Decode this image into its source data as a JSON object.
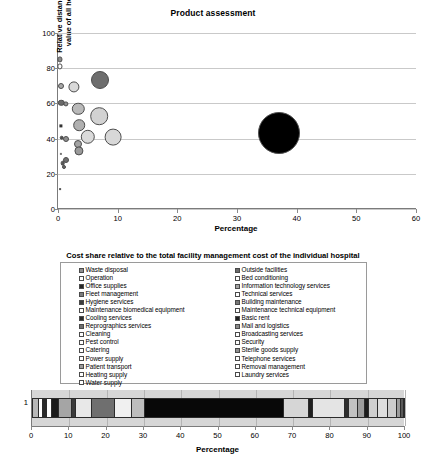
{
  "chart_data": [
    {
      "type": "scatter",
      "id": "bubble-chart",
      "title": "Product assessment",
      "xlabel": "Percentage",
      "ylabel": "Relative distance to average value of all hospitals (%)",
      "xlim": [
        0,
        60
      ],
      "ylim": [
        0,
        100
      ],
      "xticks": [
        0,
        10,
        20,
        30,
        40,
        50,
        60
      ],
      "yticks": [
        0,
        20,
        40,
        60,
        80,
        100
      ],
      "grid": "horizontal",
      "legend": "none",
      "points": [
        {
          "x": 0.35,
          "y": 85.0,
          "r": 2.6,
          "color": "#8c8c8c"
        },
        {
          "x": 0.35,
          "y": 81.0,
          "r": 2.6,
          "color": "#ffffff"
        },
        {
          "x": 0.45,
          "y": 70.0,
          "r": 3.0,
          "color": "#a8a8a8"
        },
        {
          "x": 2.6,
          "y": 69.5,
          "r": 5.6,
          "color": "#d9d9d9"
        },
        {
          "x": 7.0,
          "y": 73.5,
          "r": 9.0,
          "color": "#6e6e6e"
        },
        {
          "x": 0.55,
          "y": 60.5,
          "r": 3.2,
          "color": "#6b6b6b"
        },
        {
          "x": 1.3,
          "y": 59.8,
          "r": 2.6,
          "color": "#909090"
        },
        {
          "x": 3.4,
          "y": 57.0,
          "r": 6.2,
          "color": "#b9b9b9"
        },
        {
          "x": 6.9,
          "y": 52.8,
          "r": 8.8,
          "color": "#d2d2d2"
        },
        {
          "x": 3.6,
          "y": 47.5,
          "r": 5.8,
          "color": "#b0b0b0"
        },
        {
          "x": 0.5,
          "y": 47.0,
          "r": 1.6,
          "color": "#333333"
        },
        {
          "x": 0.6,
          "y": 40.5,
          "r": 2.3,
          "color": "#4f4f4f"
        },
        {
          "x": 1.4,
          "y": 40.0,
          "r": 3.0,
          "color": "#8f8f8f"
        },
        {
          "x": 5.0,
          "y": 41.0,
          "r": 7.2,
          "color": "#dadada"
        },
        {
          "x": 9.3,
          "y": 40.8,
          "r": 8.4,
          "color": "#d8d8d8"
        },
        {
          "x": 3.4,
          "y": 36.8,
          "r": 4.0,
          "color": "#a3a3a3"
        },
        {
          "x": 3.5,
          "y": 33.0,
          "r": 4.6,
          "color": "#9a9a9a"
        },
        {
          "x": 0.5,
          "y": 31.5,
          "r": 1.1,
          "color": "#777777"
        },
        {
          "x": 1.3,
          "y": 28.0,
          "r": 3.0,
          "color": "#6f6f6f"
        },
        {
          "x": 0.8,
          "y": 26.0,
          "r": 2.3,
          "color": "#595959"
        },
        {
          "x": 1.0,
          "y": 24.0,
          "r": 2.0,
          "color": "#6a6a6a"
        },
        {
          "x": 0.4,
          "y": 11.5,
          "r": 0.9,
          "color": "#555555"
        },
        {
          "x": 37.0,
          "y": 43.0,
          "r": 21.0,
          "color": "#000000"
        }
      ]
    },
    {
      "type": "bar",
      "id": "stacked-bar",
      "orientation": "horizontal",
      "stacked": true,
      "title": "Cost share relative to the total facility management cost of the individual hospital",
      "xlabel": "Percentage",
      "categories": [
        "1"
      ],
      "xlim": [
        0,
        100
      ],
      "xticks": [
        0,
        10,
        20,
        30,
        40,
        50,
        60,
        70,
        80,
        90,
        100
      ],
      "segments": [
        {
          "label": "Waste disposal",
          "value": 1.5,
          "color": "#b8b8b8"
        },
        {
          "label": "Operation",
          "value": 1.2,
          "color": "#ffffff"
        },
        {
          "label": "Office supplies",
          "value": 1.1,
          "color": "#2a2a2a"
        },
        {
          "label": "Fleet management",
          "value": 1.2,
          "color": "#ffffff"
        },
        {
          "label": "Hygiene services",
          "value": 2.0,
          "color": "#1a1a1a"
        },
        {
          "label": "Maintenance biomedical equipment",
          "value": 3.6,
          "color": "#a5a5a5"
        },
        {
          "label": "Cooling services",
          "value": 1.1,
          "color": "#3a3a3a"
        },
        {
          "label": "Reprographics services",
          "value": 4.3,
          "color": "#e8e8e8"
        },
        {
          "label": "Cleaning",
          "value": 6.2,
          "color": "#6f6f6f"
        },
        {
          "label": "Pest control",
          "value": 4.5,
          "color": "#f0f0f0"
        },
        {
          "label": "Catering",
          "value": 3.4,
          "color": "#bdbdbd"
        },
        {
          "label": "Power supply",
          "value": 37.5,
          "color": "#080808"
        },
        {
          "label": "Patient transport",
          "value": 6.8,
          "color": "#d6d6d6"
        },
        {
          "label": "Heating supply",
          "value": 1.0,
          "color": "#1f1f1f"
        },
        {
          "label": "Water supply",
          "value": 8.7,
          "color": "#e4e4e4"
        },
        {
          "label": "Outside facilities",
          "value": 1.1,
          "color": "#2d2d2d"
        },
        {
          "label": "Bed conditioning",
          "value": 2.3,
          "color": "#c2c2c2"
        },
        {
          "label": "Information technology services",
          "value": 2.0,
          "color": "#9d9d9d"
        },
        {
          "label": "Technical services",
          "value": 1.0,
          "color": "#1c1c1c"
        },
        {
          "label": "Building maintenance",
          "value": 2.5,
          "color": "#cfcfcf"
        },
        {
          "label": "Maintenance technical equipment",
          "value": 2.6,
          "color": "#dddddd"
        },
        {
          "label": "Basic rent",
          "value": 2.5,
          "color": "#cccccc"
        },
        {
          "label": "Mail and logistics",
          "value": 1.2,
          "color": "#9b9b9b"
        },
        {
          "label": "Broadcasting services",
          "value": 0.7,
          "color": "#5a5a5a"
        }
      ]
    }
  ],
  "bubble_chart": {
    "title": "Product assessment",
    "ylabel_line1": "Relative distance to average",
    "ylabel_line2": "value of all hospitals (%)",
    "xlabel": "Percentage",
    "xticks": [
      "0",
      "10",
      "20",
      "30",
      "40",
      "50",
      "60"
    ],
    "yticks": [
      "100",
      "80",
      "60",
      "40",
      "20",
      "0"
    ]
  },
  "legend": {
    "title": "Cost share relative to the total facility management cost of the individual hospital",
    "column_left": [
      {
        "label": "Waste disposal",
        "color": "#8f8f8f"
      },
      {
        "label": "Operation",
        "color": "#ffffff"
      },
      {
        "label": "Office supplies",
        "color": "#262626"
      },
      {
        "label": "Fleet management",
        "color": "#7d7d7d"
      },
      {
        "label": "Hygiene services",
        "color": "#3d3d3d"
      },
      {
        "label": "Maintenance biomedical equipment",
        "color": "#ffffff"
      },
      {
        "label": "Cooling services",
        "color": "#2b2b2b"
      },
      {
        "label": "Reprographics services",
        "color": "#6e6e6e"
      },
      {
        "label": "Cleaning",
        "color": "#ffffff"
      },
      {
        "label": "Pest control",
        "color": "#ffffff"
      },
      {
        "label": "Catering",
        "color": "#ffffff"
      },
      {
        "label": "Power supply",
        "color": "#ffffff"
      },
      {
        "label": "Patient transport",
        "color": "#9a9a9a"
      },
      {
        "label": "Heating supply",
        "color": "#ffffff"
      },
      {
        "label": "Water supply",
        "color": "#ffffff"
      }
    ],
    "column_right": [
      {
        "label": "Outside facilities",
        "color": "#6a6a6a"
      },
      {
        "label": "Bed conditioning",
        "color": "#ffffff"
      },
      {
        "label": "Information technology services",
        "color": "#a3a3a3"
      },
      {
        "label": "Technical services",
        "color": "#ffffff"
      },
      {
        "label": "Building maintenance",
        "color": "#767676"
      },
      {
        "label": "Maintenance technical equipment",
        "color": "#ffffff"
      },
      {
        "label": "Basic rent",
        "color": "#1f1f1f"
      },
      {
        "label": "Mail and logistics",
        "color": "#8b8b8b"
      },
      {
        "label": "Broadcasting services",
        "color": "#ffffff"
      },
      {
        "label": "Security",
        "color": "#ffffff"
      },
      {
        "label": "Sterile goods supply",
        "color": "#8f8f8f"
      },
      {
        "label": "Telephone services",
        "color": "#ffffff"
      },
      {
        "label": "Removal management",
        "color": "#ffffff"
      },
      {
        "label": "Laundry services",
        "color": "#ffffff"
      }
    ]
  },
  "stacked_chart": {
    "category_label": "1",
    "xlabel": "Percentage",
    "xticks": [
      "0",
      "10",
      "20",
      "30",
      "40",
      "50",
      "60",
      "70",
      "80",
      "90",
      "100"
    ]
  }
}
